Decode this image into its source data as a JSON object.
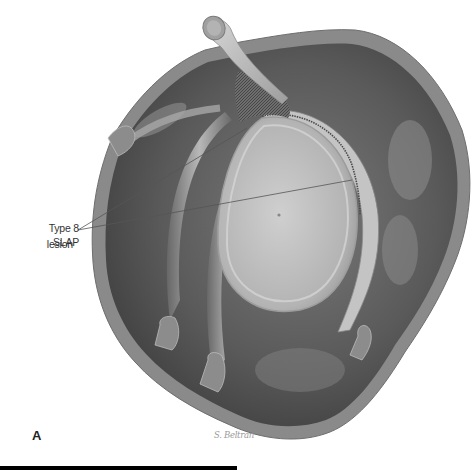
{
  "figure": {
    "panel_label": "A",
    "callout": {
      "line1": "Type 8 SLAP",
      "line2": "lesion",
      "leader_origin": [
        78,
        230
      ],
      "leader_targets": [
        [
          247,
          128
        ],
        [
          352,
          180
        ]
      ]
    },
    "signature": "S. Beltran",
    "structures": [
      "biceps-tendon",
      "superior-labrum-biceps-anchor",
      "glenoid-fossa",
      "posterior-labrum",
      "joint-capsule",
      "glenohumeral-ligaments"
    ],
    "colors": {
      "background": "#ffffff",
      "capsule_dark": "#4a4a4a",
      "capsule_wall": "#8c8c8c",
      "glenoid": "#bdbdbd",
      "labrum": "#d9d9d9",
      "leader_line": "#555555",
      "bottom_bar": "#000000"
    }
  }
}
